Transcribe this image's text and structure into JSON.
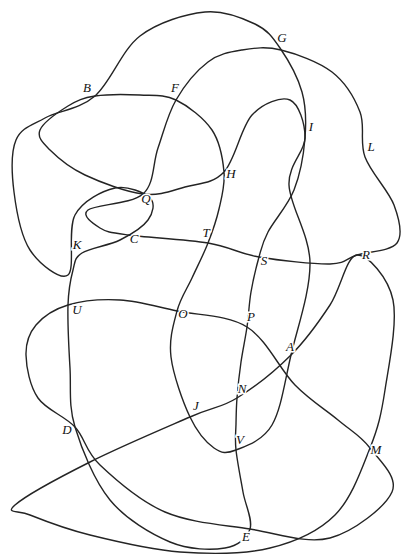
{
  "figure": {
    "width": 416,
    "height": 559,
    "background_color": "#ffffff",
    "stroke_color": "#242424",
    "stroke_width": 1.4,
    "label_font_size": 13,
    "labels": [
      {
        "text": "A",
        "x": 290,
        "y": 351
      },
      {
        "text": "B",
        "x": 87,
        "y": 92
      },
      {
        "text": "C",
        "x": 134,
        "y": 243
      },
      {
        "text": "D",
        "x": 67,
        "y": 434
      },
      {
        "text": "E",
        "x": 246,
        "y": 541
      },
      {
        "text": "F",
        "x": 175,
        "y": 92
      },
      {
        "text": "G",
        "x": 282,
        "y": 42
      },
      {
        "text": "H",
        "x": 231,
        "y": 178
      },
      {
        "text": "I",
        "x": 311,
        "y": 131
      },
      {
        "text": "J",
        "x": 196,
        "y": 410
      },
      {
        "text": "K",
        "x": 77,
        "y": 249
      },
      {
        "text": "L",
        "x": 371,
        "y": 151
      },
      {
        "text": "M",
        "x": 376,
        "y": 454
      },
      {
        "text": "N",
        "x": 242,
        "y": 393
      },
      {
        "text": "O",
        "x": 183,
        "y": 318
      },
      {
        "text": "P",
        "x": 251,
        "y": 321
      },
      {
        "text": "Q",
        "x": 146,
        "y": 203
      },
      {
        "text": "R",
        "x": 366,
        "y": 259
      },
      {
        "text": "S",
        "x": 264,
        "y": 265
      },
      {
        "text": "T",
        "x": 206,
        "y": 237
      },
      {
        "text": "U",
        "x": 77,
        "y": 314
      },
      {
        "text": "V",
        "x": 240,
        "y": 444
      }
    ],
    "curves": [
      {
        "name": "curve-1",
        "points": [
          [
            205,
            12
          ],
          [
            255,
            24
          ],
          [
            280,
            48
          ],
          [
            302,
            92
          ],
          [
            305,
            138
          ],
          [
            294,
            190
          ],
          [
            268,
            232
          ],
          [
            259,
            257
          ],
          [
            251,
            292
          ],
          [
            247,
            327
          ],
          [
            241,
            362
          ],
          [
            237,
            398
          ],
          [
            236,
            424
          ],
          [
            236,
            450
          ],
          [
            243,
            492
          ],
          [
            250,
            529
          ],
          [
            225,
            548
          ],
          [
            170,
            542
          ],
          [
            110,
            500
          ],
          [
            75,
            427
          ],
          [
            70,
            368
          ],
          [
            68,
            305
          ],
          [
            73,
            270
          ],
          [
            82,
            253
          ],
          [
            120,
            240
          ],
          [
            148,
            220
          ],
          [
            150,
            198
          ],
          [
            115,
            188
          ],
          [
            75,
            215
          ],
          [
            68,
            275
          ],
          [
            30,
            250
          ],
          [
            14,
            192
          ],
          [
            16,
            140
          ],
          [
            45,
            118
          ],
          [
            95,
            96
          ],
          [
            140,
            36
          ]
        ]
      },
      {
        "name": "curve-2",
        "points": [
          [
            40,
            130
          ],
          [
            68,
            106
          ],
          [
            95,
            96
          ],
          [
            140,
            95
          ],
          [
            176,
            100
          ],
          [
            212,
            130
          ],
          [
            224,
            172
          ],
          [
            219,
            209
          ],
          [
            208,
            243
          ],
          [
            192,
            278
          ],
          [
            177,
            311
          ],
          [
            171,
            357
          ],
          [
            190,
            417
          ],
          [
            214,
            448
          ],
          [
            236,
            450
          ],
          [
            272,
            425
          ],
          [
            291,
            355
          ],
          [
            310,
            263
          ],
          [
            289,
            185
          ],
          [
            305,
            138
          ],
          [
            290,
            100
          ],
          [
            252,
            115
          ],
          [
            224,
            172
          ],
          [
            185,
            187
          ],
          [
            143,
            194
          ],
          [
            85,
            175
          ],
          [
            50,
            150
          ]
        ]
      },
      {
        "name": "curve-3",
        "points": [
          [
            143,
            194
          ],
          [
            158,
            148
          ],
          [
            176,
            100
          ],
          [
            208,
            62
          ],
          [
            242,
            50
          ],
          [
            281,
            50
          ],
          [
            332,
            72
          ],
          [
            360,
            112
          ],
          [
            365,
            157
          ],
          [
            394,
            205
          ],
          [
            397,
            243
          ],
          [
            357,
            255
          ],
          [
            330,
            264
          ],
          [
            259,
            257
          ],
          [
            208,
            243
          ],
          [
            128,
            235
          ],
          [
            100,
            228
          ],
          [
            88,
            210
          ]
        ]
      },
      {
        "name": "curve-4",
        "points": [
          [
            68,
            305
          ],
          [
            120,
            300
          ],
          [
            177,
            311
          ],
          [
            247,
            327
          ],
          [
            295,
            385
          ],
          [
            338,
            420
          ],
          [
            370,
            448
          ],
          [
            392,
            492
          ],
          [
            330,
            538
          ],
          [
            250,
            529
          ],
          [
            165,
            512
          ],
          [
            100,
            465
          ],
          [
            75,
            427
          ],
          [
            38,
            398
          ],
          [
            26,
            355
          ],
          [
            36,
            325
          ]
        ]
      },
      {
        "name": "curve-5",
        "points": [
          [
            15,
            505
          ],
          [
            90,
            462
          ],
          [
            190,
            417
          ],
          [
            237,
            398
          ],
          [
            291,
            355
          ],
          [
            330,
            305
          ],
          [
            357,
            255
          ],
          [
            393,
            300
          ],
          [
            385,
            390
          ],
          [
            370,
            448
          ],
          [
            335,
            515
          ],
          [
            270,
            548
          ],
          [
            180,
            552
          ],
          [
            90,
            535
          ],
          [
            30,
            515
          ]
        ]
      }
    ]
  }
}
